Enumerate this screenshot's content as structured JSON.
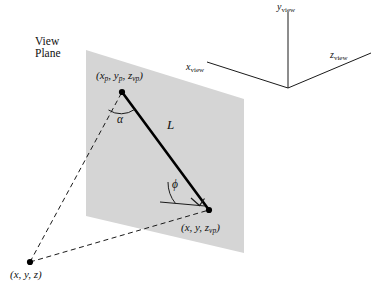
{
  "figure": {
    "background_color": "#ffffff",
    "plane_fill_color": "#d5d5d5",
    "line_color": "#000000"
  },
  "view_plane": {
    "caption_line1": "View",
    "caption_line2": "Plane",
    "polygon_points": "86,50 244,99 244,253 86,216"
  },
  "points": {
    "projected_point": {
      "label": "(x",
      "label_sub1": "p",
      "label_mid": ", y",
      "label_sub2": "p",
      "label_mid2": ", z",
      "label_sub3": "vp",
      "label_end": ")",
      "full_label": "(xp, yp, zvp)",
      "x": 122,
      "y": 92
    },
    "plane_point": {
      "full_label": "(x, y, zvp)",
      "x": 209,
      "y": 210
    },
    "world_point": {
      "full_label": "(x, y, z)",
      "x": 30,
      "y": 262
    }
  },
  "annotations": {
    "length_label": "L",
    "alpha_label": "α",
    "phi_label": "ϕ",
    "right_angle": "right-angle-marker"
  },
  "axes": {
    "origin": {
      "x": 288,
      "y": 88
    },
    "y_axis": {
      "name": "y",
      "subscript": "view",
      "tip_x": 288,
      "tip_y": 12
    },
    "x_axis": {
      "name": "x",
      "subscript": "view",
      "tip_x": 207,
      "tip_y": 62
    },
    "z_axis": {
      "name": "z",
      "subscript": "view",
      "tip_x": 371,
      "tip_y": 53
    }
  },
  "coord_labels": {
    "projected": {
      "base": "(x",
      "s1": "p",
      "t1": ", y",
      "s2": "p",
      "t2": ", z",
      "s3": "vp",
      "t3": ")"
    },
    "plane": {
      "base": "(x, y, z",
      "s1": "vp",
      "t1": ")"
    },
    "world": {
      "base": "(x, y, z)"
    }
  }
}
